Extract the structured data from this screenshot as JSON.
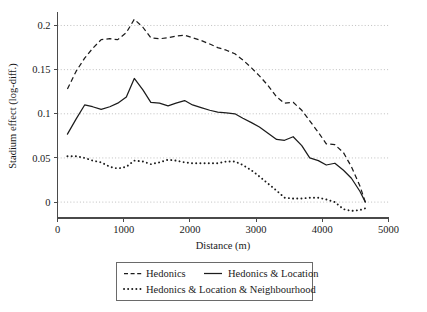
{
  "chart_data": {
    "type": "line",
    "title": "",
    "xlabel": "Distance (m)",
    "ylabel": "Stadium effect (log-diff.)",
    "xlim": [
      0,
      5000
    ],
    "ylim": [
      -0.018,
      0.213
    ],
    "grid": true,
    "legend_position": "bottom",
    "xticks": [
      0,
      1000,
      2000,
      3000,
      4000,
      5000
    ],
    "xtick_labels": [
      "0",
      "1000",
      "2000",
      "3000",
      "4000",
      "5000"
    ],
    "yticks": [
      0,
      0.05,
      0.1,
      0.15,
      0.2
    ],
    "ytick_labels": [
      "0",
      "0.05",
      "0.1",
      "0.15",
      "0.2"
    ],
    "series": [
      {
        "name": "Hedonics",
        "style": "dashed",
        "x": [
          150,
          280,
          410,
          530,
          660,
          790,
          910,
          1040,
          1160,
          1290,
          1410,
          1540,
          1670,
          1790,
          1920,
          2040,
          2170,
          2300,
          2420,
          2550,
          2680,
          2800,
          2930,
          3050,
          3180,
          3310,
          3430,
          3560,
          3690,
          3810,
          3940,
          4060,
          4190,
          4320,
          4440,
          4570,
          4650
        ],
        "y": [
          0.128,
          0.148,
          0.163,
          0.174,
          0.184,
          0.185,
          0.184,
          0.192,
          0.207,
          0.198,
          0.186,
          0.185,
          0.186,
          0.188,
          0.189,
          0.186,
          0.183,
          0.179,
          0.175,
          0.172,
          0.168,
          0.161,
          0.152,
          0.143,
          0.132,
          0.119,
          0.112,
          0.113,
          0.104,
          0.092,
          0.079,
          0.066,
          0.065,
          0.056,
          0.04,
          0.018,
          0.0
        ]
      },
      {
        "name": "Hedonics & Location",
        "style": "solid",
        "x": [
          150,
          280,
          410,
          530,
          660,
          790,
          910,
          1040,
          1160,
          1290,
          1410,
          1540,
          1670,
          1790,
          1920,
          2040,
          2170,
          2300,
          2420,
          2550,
          2680,
          2800,
          2930,
          3050,
          3180,
          3310,
          3430,
          3560,
          3690,
          3810,
          3940,
          4060,
          4190,
          4320,
          4440,
          4570,
          4650
        ],
        "y": [
          0.077,
          0.094,
          0.11,
          0.108,
          0.105,
          0.108,
          0.112,
          0.119,
          0.14,
          0.127,
          0.113,
          0.112,
          0.109,
          0.112,
          0.115,
          0.11,
          0.107,
          0.104,
          0.102,
          0.101,
          0.1,
          0.095,
          0.09,
          0.085,
          0.078,
          0.071,
          0.07,
          0.074,
          0.064,
          0.05,
          0.047,
          0.042,
          0.044,
          0.036,
          0.027,
          0.012,
          0.0
        ]
      },
      {
        "name": "Hedonics & Location & Neighbourhood",
        "style": "dotted",
        "x": [
          150,
          280,
          410,
          530,
          660,
          790,
          910,
          1040,
          1160,
          1290,
          1410,
          1540,
          1670,
          1790,
          1920,
          2040,
          2170,
          2300,
          2420,
          2550,
          2680,
          2800,
          2930,
          3050,
          3180,
          3310,
          3430,
          3560,
          3690,
          3810,
          3940,
          4060,
          4190,
          4320,
          4440,
          4570,
          4650
        ],
        "y": [
          0.052,
          0.052,
          0.05,
          0.047,
          0.045,
          0.04,
          0.038,
          0.04,
          0.047,
          0.046,
          0.043,
          0.045,
          0.048,
          0.047,
          0.045,
          0.044,
          0.044,
          0.044,
          0.044,
          0.046,
          0.046,
          0.042,
          0.036,
          0.029,
          0.021,
          0.013,
          0.005,
          0.004,
          0.004,
          0.005,
          0.005,
          0.003,
          0.0,
          -0.008,
          -0.01,
          -0.009,
          -0.007
        ]
      }
    ]
  },
  "legend": {
    "items": [
      {
        "label": "Hedonics",
        "style": "dashed"
      },
      {
        "label": "Hedonics & Location",
        "style": "solid"
      },
      {
        "label": "Hedonics & Location & Neighbourhood",
        "style": "dotted"
      }
    ]
  },
  "accent_colors": {
    "line": "#1c1c1c",
    "grid": "#b9b9b9",
    "axis": "#4a4a4a",
    "text": "#1a1a1a",
    "background": "#ffffff"
  }
}
